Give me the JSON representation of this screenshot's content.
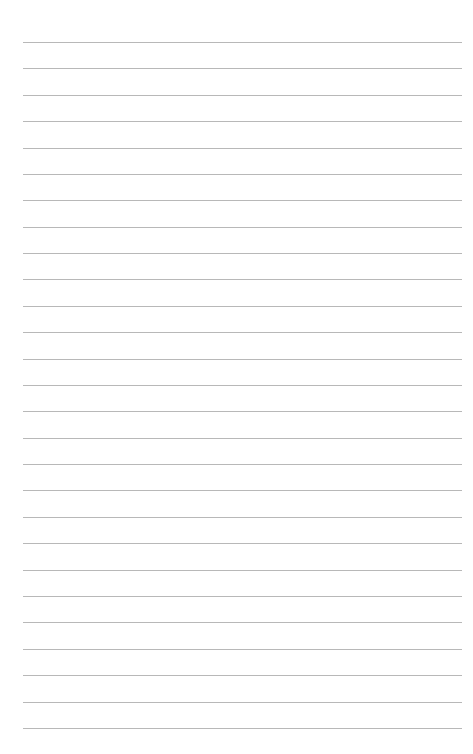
{
  "page": {
    "type": "blank lined paper",
    "line_count": 27,
    "first_line_y": 42,
    "line_spacing": 26.38,
    "line_left": 23,
    "line_width": 439,
    "line_color": "#b8b8b8",
    "background_color": "#ffffff"
  }
}
